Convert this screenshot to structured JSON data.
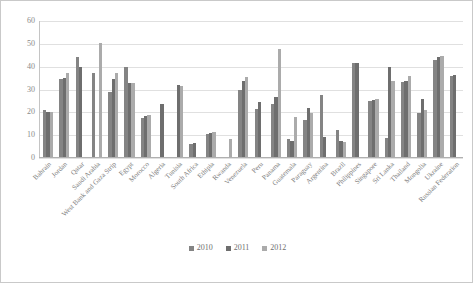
{
  "chart_data": {
    "type": "bar",
    "title": "",
    "subtitle": "",
    "xlabel": "",
    "ylabel": "",
    "ylim": [
      0,
      60
    ],
    "yticks": [
      0,
      10,
      20,
      30,
      40,
      50,
      60
    ],
    "grid": true,
    "legend_position": "bottom",
    "categories": [
      "Bahrain",
      "Jordan",
      "Qatar",
      "Saudi Arabia",
      "West Bank and Gaza Strip",
      "Egypt",
      "Morocco",
      "Algeria",
      "Tunisia",
      "South Africa",
      "Ethipia",
      "Rwanda",
      "Venezuela",
      "Peru",
      "Panama",
      "Guatemala",
      "Paraguay",
      "Argentina",
      "Brazil",
      "Philippines",
      "Singapore",
      "Sri Lanka",
      "Thailand",
      "Mongolia",
      "Ukraine",
      "Russian Federation"
    ],
    "series": [
      {
        "name": "2010",
        "color": "#848484",
        "values": [
          20.8,
          34.3,
          43.6,
          36.9,
          28.5,
          39.6,
          17.3,
          null,
          null,
          5.9,
          9.9,
          null,
          29.2,
          21.1,
          23.2,
          7.9,
          16.2,
          27.2,
          12.0,
          41.3,
          24.6,
          8.2,
          32.8,
          19.4,
          42.3,
          35.6
        ]
      },
      {
        "name": "2011",
        "color": "#6e6e6e",
        "values": [
          19.9,
          34.4,
          39.4,
          null,
          34.2,
          32.4,
          17.9,
          23.1,
          31.7,
          6.0,
          10.3,
          null,
          33.1,
          23.9,
          26.2,
          7.0,
          21.4,
          8.6,
          6.9,
          41.3,
          25.0,
          39.5,
          33.1,
          25.2,
          44.0,
          36.0
        ]
      },
      {
        "name": "2012",
        "color": "#ababab",
        "values": [
          19.9,
          36.8,
          null,
          49.8,
          36.6,
          32.3,
          18.3,
          null,
          30.9,
          null,
          11.1,
          8.1,
          35.2,
          null,
          47.3,
          17.6,
          19.2,
          null,
          6.6,
          null,
          25.4,
          33.3,
          35.6,
          20.5,
          44.4,
          null
        ]
      }
    ]
  },
  "legend": {
    "items": [
      {
        "label": "2010",
        "key": "s2010"
      },
      {
        "label": "2011",
        "key": "s2011"
      },
      {
        "label": "2012",
        "key": "s2012"
      }
    ]
  }
}
